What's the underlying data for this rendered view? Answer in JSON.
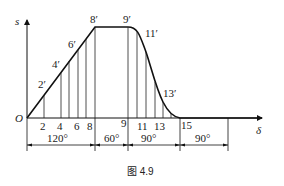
{
  "figure": {
    "caption": "图 4.9",
    "y_axis_label": "s",
    "x_axis_label": "δ",
    "origin_label": "O"
  },
  "curve_points": {
    "p2": "2′",
    "p4": "4′",
    "p6": "6′",
    "p8": "8′",
    "p9": "9′",
    "p11": "11′",
    "p13": "13′"
  },
  "axis_ticks": {
    "t2": "2",
    "t4": "4",
    "t6": "6",
    "t8": "8",
    "t9": "9",
    "t11": "11",
    "t13": "13",
    "t15": "15"
  },
  "dimensions": [
    {
      "label": "120°",
      "phase": "rise"
    },
    {
      "label": "60°",
      "phase": "far dwell"
    },
    {
      "label": "90°",
      "phase": "return"
    },
    {
      "label": "90°",
      "phase": "near dwell"
    }
  ]
}
